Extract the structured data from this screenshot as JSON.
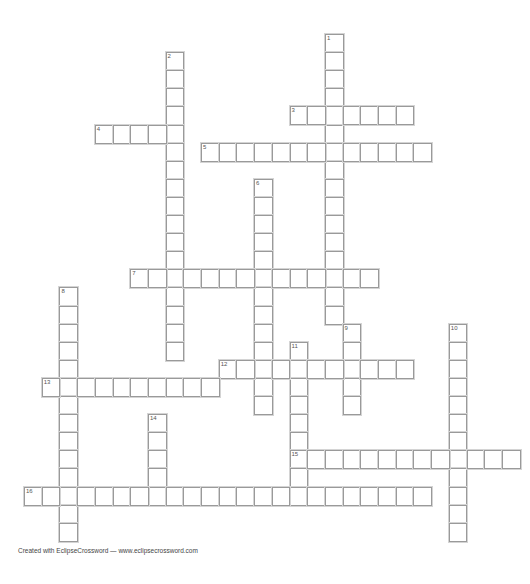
{
  "puzzle": {
    "title": "",
    "grid": {
      "origin_x": 24,
      "origin_y": 34,
      "cell_w": 17.7,
      "cell_h": 18.1
    },
    "words": [
      {
        "number": 1,
        "direction": "down",
        "row": 0,
        "col": 17,
        "length": 16
      },
      {
        "number": 2,
        "direction": "down",
        "row": 1,
        "col": 8,
        "length": 17
      },
      {
        "number": 3,
        "direction": "across",
        "row": 4,
        "col": 15,
        "length": 7
      },
      {
        "number": 4,
        "direction": "across",
        "row": 5,
        "col": 4,
        "length": 5
      },
      {
        "number": 5,
        "direction": "across",
        "row": 6,
        "col": 10,
        "length": 13
      },
      {
        "number": 6,
        "direction": "down",
        "row": 8,
        "col": 13,
        "length": 13
      },
      {
        "number": 7,
        "direction": "across",
        "row": 13,
        "col": 6,
        "length": 14
      },
      {
        "number": 8,
        "direction": "down",
        "row": 14,
        "col": 2,
        "length": 14
      },
      {
        "number": 9,
        "direction": "down",
        "row": 16,
        "col": 18,
        "length": 5
      },
      {
        "number": 10,
        "direction": "down",
        "row": 16,
        "col": 24,
        "length": 12
      },
      {
        "number": 11,
        "direction": "down",
        "row": 17,
        "col": 15,
        "length": 9
      },
      {
        "number": 12,
        "direction": "across",
        "row": 18,
        "col": 11,
        "length": 11
      },
      {
        "number": 13,
        "direction": "across",
        "row": 19,
        "col": 1,
        "length": 10
      },
      {
        "number": 14,
        "direction": "down",
        "row": 21,
        "col": 7,
        "length": 5
      },
      {
        "number": 15,
        "direction": "across",
        "row": 23,
        "col": 15,
        "length": 13
      },
      {
        "number": 16,
        "direction": "across",
        "row": 25,
        "col": 0,
        "length": 23
      }
    ]
  },
  "footer": {
    "text": "Created with EclipseCrossword — www.eclipsecrossword.com"
  }
}
